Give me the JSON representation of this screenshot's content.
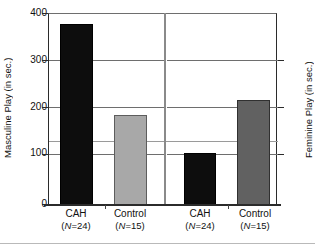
{
  "chart_data": {
    "type": "bar",
    "title": "",
    "categories": [
      "CAH (N=24)",
      "Control (N=15)",
      "CAH (N=24)",
      "Control (N=15)"
    ],
    "values": [
      380,
      190,
      110,
      220
    ],
    "panels": [
      {
        "name": "Masculine Play",
        "ylabel": "Masculine Play (in sec.)",
        "categories": [
          "CAH",
          "Control"
        ],
        "group_sizes": [
          "(N=24)",
          "(N=15)"
        ],
        "values": [
          380,
          190
        ],
        "colors": [
          "#0d0d0d",
          "#a8a8a8"
        ]
      },
      {
        "name": "Feminine Play",
        "ylabel": "Feminine Play (in sec.)",
        "categories": [
          "CAH",
          "Control"
        ],
        "group_sizes": [
          "(N=24)",
          "(N=15)"
        ],
        "values": [
          110,
          220
        ],
        "colors": [
          "#0d0d0d",
          "#616161"
        ]
      }
    ],
    "ylabel": "Masculine Play (in sec.)",
    "ylabel_right": "Feminine Play (in sec.)",
    "xlabel": "",
    "ylim": [
      0,
      400
    ],
    "yticks": [
      0,
      100,
      200,
      300,
      400
    ],
    "ytick_labels": [
      "0",
      "100",
      "200",
      "300",
      "400"
    ],
    "right_yticks": [
      100,
      200,
      300
    ],
    "grid": true,
    "legend": "none"
  },
  "axes": {
    "left_title": "Masculine Play (in sec.)",
    "right_title": "Feminine Play (in sec.)",
    "tick_400": "400",
    "tick_300": "300",
    "tick_200": "200",
    "tick_100": "100",
    "tick_0": "0"
  },
  "bars": [
    {
      "label": "CAH",
      "n": "(N=24)",
      "value": 380,
      "color": "#0d0d0d"
    },
    {
      "label": "Control",
      "n": "(N=15)",
      "value": 190,
      "color": "#a8a8a8"
    },
    {
      "label": "CAH",
      "n": "(N=24)",
      "value": 110,
      "color": "#0d0d0d"
    },
    {
      "label": "Control",
      "n": "(N=15)",
      "value": 220,
      "color": "#616161"
    }
  ],
  "x_labels": [
    {
      "name": "CAH",
      "n_prefix": "(",
      "n_italic": "N",
      "n_suffix": "=24)"
    },
    {
      "name": "Control",
      "n_prefix": "(",
      "n_italic": "N",
      "n_suffix": "=15)"
    },
    {
      "name": "CAH",
      "n_prefix": "(",
      "n_italic": "N",
      "n_suffix": "=24)"
    },
    {
      "name": "Control",
      "n_prefix": "(",
      "n_italic": "N",
      "n_suffix": "=15)"
    }
  ]
}
